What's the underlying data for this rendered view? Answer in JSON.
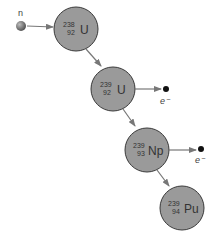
{
  "diagram": {
    "colors": {
      "nucleus_fill": "#9a9a9a",
      "nucleus_stroke": "#3a3a3a",
      "arrow": "#777777",
      "neutron": "#6a6a6a",
      "electron": "#111111"
    },
    "neutron": {
      "label": "n"
    },
    "nuclei": [
      {
        "mass": "238",
        "atomic": "92",
        "symbol": "U"
      },
      {
        "mass": "239",
        "atomic": "92",
        "symbol": "U"
      },
      {
        "mass": "239",
        "atomic": "93",
        "symbol": "Np"
      },
      {
        "mass": "239",
        "atomic": "94",
        "symbol": "Pu"
      }
    ],
    "electrons": [
      {
        "label": "e⁻"
      },
      {
        "label": "e⁻"
      }
    ]
  }
}
